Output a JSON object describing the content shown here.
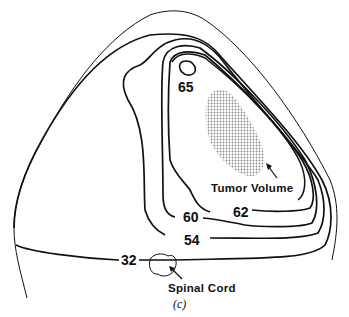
{
  "figure": {
    "caption": "(c)",
    "isodose_labels": {
      "d65": "65",
      "d62": "62",
      "d60": "60",
      "d54": "54",
      "d32": "32"
    },
    "annotations": {
      "tumor": "Tumor Volume",
      "cord": "Spinal Cord"
    },
    "colors": {
      "line": "#111111",
      "tumor_fill": "#9a9a9a",
      "background": "#ffffff"
    }
  }
}
